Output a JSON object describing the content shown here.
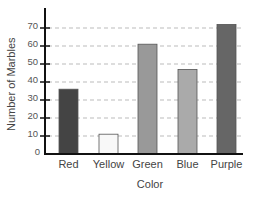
{
  "chart_data": {
    "type": "bar",
    "title": "",
    "xlabel": "Color",
    "ylabel": "Number of Marbles",
    "categories": [
      "Red",
      "Yellow",
      "Green",
      "Blue",
      "Purple"
    ],
    "values": [
      36,
      11,
      61,
      47,
      72
    ],
    "bar_colors": [
      "#444444",
      "#f8f8f8",
      "#999999",
      "#aaaaaa",
      "#666666"
    ],
    "ylim": [
      0,
      80
    ],
    "yticks": [
      0,
      10,
      20,
      30,
      40,
      50,
      60,
      70
    ],
    "grid": "horizontal dashed",
    "legend": "none"
  }
}
